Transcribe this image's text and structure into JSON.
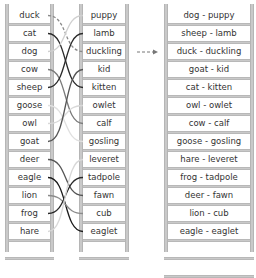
{
  "left_column": {
    "title": "",
    "items": [
      "duck",
      "cat",
      "dog",
      "cow",
      "sheep",
      "goose",
      "owl",
      "goat",
      "deer",
      "eagle",
      "lion",
      "frog",
      "hare"
    ]
  },
  "middle_column": {
    "items": [
      "puppy",
      "lamb",
      "duckling",
      "kid",
      "kitten",
      "owlet",
      "calf",
      "gosling",
      "leveret",
      "tadpole",
      "fawn",
      "cub",
      "eaglet"
    ]
  },
  "right_column": {
    "items": [
      "dog - puppy",
      "sheep - lamb",
      "duck - duckling",
      "goat - kid",
      "cat - kitten",
      "owl - owlet",
      "cow - calf",
      "goose - gosling",
      "hare - leveret",
      "frog - tadpole",
      "deer - fawn",
      "lion - cub",
      "eagle - eaglet",
      ""
    ]
  },
  "links": [
    {
      "from": 0,
      "to": 2,
      "style": "dashed",
      "color": "#8a8a8a"
    },
    {
      "from": 1,
      "to": 4,
      "style": "solid",
      "color": "#2a2a2a"
    },
    {
      "from": 2,
      "to": 0,
      "style": "solid",
      "color": "#d0d0d0"
    },
    {
      "from": 3,
      "to": 6,
      "style": "solid",
      "color": "#7a7a7a"
    },
    {
      "from": 4,
      "to": 1,
      "style": "solid",
      "color": "#2a2a2a"
    },
    {
      "from": 5,
      "to": 7,
      "style": "solid",
      "color": "#e0e0e0"
    },
    {
      "from": 6,
      "to": 5,
      "style": "solid",
      "color": "#d8d8d8"
    },
    {
      "from": 7,
      "to": 3,
      "style": "solid",
      "color": "#555555"
    },
    {
      "from": 8,
      "to": 10,
      "style": "solid",
      "color": "#555555"
    },
    {
      "from": 9,
      "to": 12,
      "style": "solid",
      "color": "#1a1a1a"
    },
    {
      "from": 10,
      "to": 11,
      "style": "solid",
      "color": "#8a8a8a"
    },
    {
      "from": 11,
      "to": 9,
      "style": "solid",
      "color": "#2a2a2a"
    },
    {
      "from": 12,
      "to": 8,
      "style": "solid",
      "color": "#d8d8d8"
    }
  ],
  "arrow": {
    "style": "dashed",
    "color": "#777777",
    "direction": "right"
  },
  "colors": {
    "rail": "#c9c9c9",
    "text": "#333333",
    "background": "#ffffff"
  }
}
